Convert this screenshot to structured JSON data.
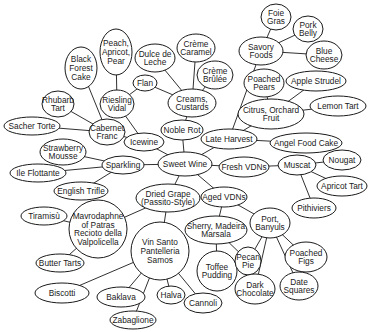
{
  "diagram": {
    "colors": {
      "line": "#1a1a1a",
      "node_fill": "#ffffff",
      "background": "#ffffff"
    },
    "nodes": [
      {
        "id": "sweet_wine",
        "lines": [
          "Sweet Wine"
        ],
        "cx": 185,
        "cy": 164,
        "rx": 27,
        "ry": 12
      },
      {
        "id": "noble_rot",
        "lines": [
          "Noble Rot"
        ],
        "cx": 182,
        "cy": 130,
        "rx": 21,
        "ry": 10
      },
      {
        "id": "creams",
        "lines": [
          "Creams,",
          "Custards"
        ],
        "cx": 192,
        "cy": 103,
        "rx": 24,
        "ry": 14
      },
      {
        "id": "flan",
        "lines": [
          "Flan"
        ],
        "cx": 145,
        "cy": 83,
        "rx": 12,
        "ry": 8
      },
      {
        "id": "dulce",
        "lines": [
          "Dulce de",
          "Leche"
        ],
        "cx": 155,
        "cy": 58,
        "rx": 20,
        "ry": 14
      },
      {
        "id": "creme_caramel",
        "lines": [
          "Crème",
          "Caramel"
        ],
        "cx": 196,
        "cy": 48,
        "rx": 19,
        "ry": 14
      },
      {
        "id": "creme_brulee",
        "lines": [
          "Crème",
          "Brûlée"
        ],
        "cx": 215,
        "cy": 75,
        "rx": 18,
        "ry": 14
      },
      {
        "id": "riesling",
        "lines": [
          "Riesling",
          "Vidal"
        ],
        "cx": 117,
        "cy": 104,
        "rx": 17,
        "ry": 14
      },
      {
        "id": "peach",
        "lines": [
          "Peach,",
          "Apricot,",
          "Pear"
        ],
        "cx": 116,
        "cy": 52,
        "rx": 16,
        "ry": 23
      },
      {
        "id": "black_forest",
        "lines": [
          "Black",
          "Forest",
          "Cake"
        ],
        "cx": 81,
        "cy": 68,
        "rx": 16,
        "ry": 21
      },
      {
        "id": "rhubarb",
        "lines": [
          "Rhubarb",
          "Tart"
        ],
        "cx": 58,
        "cy": 104,
        "rx": 16,
        "ry": 13
      },
      {
        "id": "cabernet",
        "lines": [
          "Cabernet",
          "Franc"
        ],
        "cx": 107,
        "cy": 132,
        "rx": 18,
        "ry": 13
      },
      {
        "id": "sacher",
        "lines": [
          "Sacher Torte"
        ],
        "cx": 32,
        "cy": 126,
        "rx": 28,
        "ry": 9
      },
      {
        "id": "icewine",
        "lines": [
          "Icewine"
        ],
        "cx": 144,
        "cy": 142,
        "rx": 20,
        "ry": 9
      },
      {
        "id": "strawberry",
        "lines": [
          "Strawberry",
          "Mousse"
        ],
        "cx": 63,
        "cy": 152,
        "rx": 23,
        "ry": 13
      },
      {
        "id": "sparkling",
        "lines": [
          "Sparkling"
        ],
        "cx": 123,
        "cy": 165,
        "rx": 21,
        "ry": 9
      },
      {
        "id": "ile_flottante",
        "lines": [
          "Ile Flottante"
        ],
        "cx": 38,
        "cy": 173,
        "rx": 28,
        "ry": 9
      },
      {
        "id": "english_trifle",
        "lines": [
          "English Trifle"
        ],
        "cx": 81,
        "cy": 191,
        "rx": 27,
        "ry": 9
      },
      {
        "id": "dried_grape",
        "lines": [
          "Dried Grape",
          "(Passito-Style)"
        ],
        "cx": 168,
        "cy": 198,
        "rx": 32,
        "ry": 14
      },
      {
        "id": "mavrodaphne",
        "lines": [
          "Mavrodaphne",
          "of Patras",
          "Recioto della",
          "Valpolicella"
        ],
        "cx": 98,
        "cy": 229,
        "rx": 29,
        "ry": 29
      },
      {
        "id": "tiramisu",
        "lines": [
          "Tiramisù"
        ],
        "cx": 44,
        "cy": 216,
        "rx": 23,
        "ry": 9
      },
      {
        "id": "butter_tarts",
        "lines": [
          "Butter Tarts"
        ],
        "cx": 60,
        "cy": 263,
        "rx": 24,
        "ry": 9
      },
      {
        "id": "vin_santo",
        "lines": [
          "Vin Santo",
          "Pantelleria",
          "Samos"
        ],
        "cx": 160,
        "cy": 251,
        "rx": 29,
        "ry": 29
      },
      {
        "id": "biscotti",
        "lines": [
          "Biscotti"
        ],
        "cx": 62,
        "cy": 293,
        "rx": 27,
        "ry": 10
      },
      {
        "id": "baklava",
        "lines": [
          "Baklava"
        ],
        "cx": 121,
        "cy": 297,
        "rx": 24,
        "ry": 10
      },
      {
        "id": "halva",
        "lines": [
          "Halva"
        ],
        "cx": 171,
        "cy": 295,
        "rx": 14,
        "ry": 9
      },
      {
        "id": "zabaglione",
        "lines": [
          "Zabaglione"
        ],
        "cx": 133,
        "cy": 320,
        "rx": 23,
        "ry": 9
      },
      {
        "id": "cannoli",
        "lines": [
          "Cannoli"
        ],
        "cx": 203,
        "cy": 303,
        "rx": 19,
        "ry": 10
      },
      {
        "id": "late_harvest",
        "lines": [
          "Late Harvest"
        ],
        "cx": 229,
        "cy": 139,
        "rx": 28,
        "ry": 10
      },
      {
        "id": "savory",
        "lines": [
          "Savory",
          "Foods"
        ],
        "cx": 261,
        "cy": 51,
        "rx": 22,
        "ry": 14
      },
      {
        "id": "foie_gras",
        "lines": [
          "Foie",
          "Gras"
        ],
        "cx": 276,
        "cy": 17,
        "rx": 15,
        "ry": 13
      },
      {
        "id": "pork_belly",
        "lines": [
          "Pork",
          "Belly"
        ],
        "cx": 308,
        "cy": 29,
        "rx": 15,
        "ry": 13
      },
      {
        "id": "blue_cheese",
        "lines": [
          "Blue",
          "Cheese"
        ],
        "cx": 324,
        "cy": 55,
        "rx": 18,
        "ry": 14
      },
      {
        "id": "poached_pears",
        "lines": [
          "Poached",
          "Pears"
        ],
        "cx": 264,
        "cy": 83,
        "rx": 20,
        "ry": 14
      },
      {
        "id": "apple_strudel",
        "lines": [
          "Apple Strudel"
        ],
        "cx": 316,
        "cy": 81,
        "rx": 30,
        "ry": 10
      },
      {
        "id": "citrus",
        "lines": [
          "Citrus, Orchard",
          "Fruit"
        ],
        "cx": 271,
        "cy": 114,
        "rx": 33,
        "ry": 15
      },
      {
        "id": "lemon_tart",
        "lines": [
          "Lemon Tart"
        ],
        "cx": 338,
        "cy": 106,
        "rx": 28,
        "ry": 10
      },
      {
        "id": "angel_food",
        "lines": [
          "Angel Food Cake"
        ],
        "cx": 306,
        "cy": 143,
        "rx": 36,
        "ry": 10
      },
      {
        "id": "fresh_vdns",
        "lines": [
          "Fresh VDNs"
        ],
        "cx": 244,
        "cy": 167,
        "rx": 25,
        "ry": 10
      },
      {
        "id": "muscat",
        "lines": [
          "Muscat"
        ],
        "cx": 297,
        "cy": 165,
        "rx": 19,
        "ry": 10
      },
      {
        "id": "nougat",
        "lines": [
          "Nougat"
        ],
        "cx": 342,
        "cy": 160,
        "rx": 19,
        "ry": 10
      },
      {
        "id": "apricot_tart",
        "lines": [
          "Apricot Tart"
        ],
        "cx": 342,
        "cy": 186,
        "rx": 25,
        "ry": 10
      },
      {
        "id": "pithiviers",
        "lines": [
          "Pithiviers"
        ],
        "cx": 314,
        "cy": 208,
        "rx": 22,
        "ry": 10
      },
      {
        "id": "aged_vdns",
        "lines": [
          "Aged VDNs"
        ],
        "cx": 224,
        "cy": 197,
        "rx": 23,
        "ry": 10
      },
      {
        "id": "sherry",
        "lines": [
          "Sherry, Madeira",
          "Marsala"
        ],
        "cx": 216,
        "cy": 230,
        "rx": 31,
        "ry": 14
      },
      {
        "id": "port",
        "lines": [
          "Port,",
          "Banyuls"
        ],
        "cx": 270,
        "cy": 223,
        "rx": 20,
        "ry": 15
      },
      {
        "id": "toffee",
        "lines": [
          "Toffee",
          "Pudding"
        ],
        "cx": 217,
        "cy": 271,
        "rx": 20,
        "ry": 20
      },
      {
        "id": "pecan",
        "lines": [
          "Pecan",
          "Pie"
        ],
        "cx": 248,
        "cy": 261,
        "rx": 13,
        "ry": 14
      },
      {
        "id": "poached_figs",
        "lines": [
          "Poached",
          "Figs"
        ],
        "cx": 306,
        "cy": 257,
        "rx": 21,
        "ry": 15
      },
      {
        "id": "date_squares",
        "lines": [
          "Date",
          "Squares"
        ],
        "cx": 299,
        "cy": 286,
        "rx": 19,
        "ry": 14
      },
      {
        "id": "dark_choc",
        "lines": [
          "Dark",
          "Chocolate"
        ],
        "cx": 255,
        "cy": 289,
        "rx": 20,
        "ry": 15
      }
    ],
    "edges": [
      [
        "sweet_wine",
        "noble_rot"
      ],
      [
        "noble_rot",
        "creams"
      ],
      [
        "creams",
        "flan"
      ],
      [
        "creams",
        "dulce"
      ],
      [
        "creams",
        "creme_caramel"
      ],
      [
        "creams",
        "creme_brulee"
      ],
      [
        "sweet_wine",
        "icewine"
      ],
      [
        "icewine",
        "riesling"
      ],
      [
        "icewine",
        "cabernet"
      ],
      [
        "riesling",
        "flan"
      ],
      [
        "riesling",
        "peach"
      ],
      [
        "cabernet",
        "black_forest"
      ],
      [
        "cabernet",
        "rhubarb"
      ],
      [
        "cabernet",
        "sacher"
      ],
      [
        "sweet_wine",
        "sparkling"
      ],
      [
        "sparkling",
        "strawberry"
      ],
      [
        "sparkling",
        "ile_flottante"
      ],
      [
        "sparkling",
        "english_trifle"
      ],
      [
        "sweet_wine",
        "dried_grape"
      ],
      [
        "dried_grape",
        "mavrodaphne"
      ],
      [
        "dried_grape",
        "vin_santo"
      ],
      [
        "mavrodaphne",
        "tiramisu"
      ],
      [
        "mavrodaphne",
        "butter_tarts"
      ],
      [
        "vin_santo",
        "biscotti"
      ],
      [
        "vin_santo",
        "baklava"
      ],
      [
        "vin_santo",
        "zabaglione"
      ],
      [
        "vin_santo",
        "halva"
      ],
      [
        "vin_santo",
        "cannoli"
      ],
      [
        "sweet_wine",
        "late_harvest"
      ],
      [
        "late_harvest",
        "savory"
      ],
      [
        "late_harvest",
        "citrus"
      ],
      [
        "late_harvest",
        "angel_food"
      ],
      [
        "savory",
        "foie_gras"
      ],
      [
        "savory",
        "pork_belly"
      ],
      [
        "savory",
        "blue_cheese"
      ],
      [
        "citrus",
        "poached_pears"
      ],
      [
        "citrus",
        "apple_strudel"
      ],
      [
        "citrus",
        "lemon_tart"
      ],
      [
        "sweet_wine",
        "fresh_vdns"
      ],
      [
        "fresh_vdns",
        "muscat"
      ],
      [
        "muscat",
        "nougat"
      ],
      [
        "muscat",
        "apricot_tart"
      ],
      [
        "muscat",
        "pithiviers"
      ],
      [
        "sweet_wine",
        "aged_vdns"
      ],
      [
        "aged_vdns",
        "sherry"
      ],
      [
        "aged_vdns",
        "port"
      ],
      [
        "sherry",
        "toffee"
      ],
      [
        "sherry",
        "pecan"
      ],
      [
        "port",
        "pecan"
      ],
      [
        "port",
        "dark_choc"
      ],
      [
        "port",
        "date_squares"
      ],
      [
        "port",
        "poached_figs"
      ]
    ]
  }
}
